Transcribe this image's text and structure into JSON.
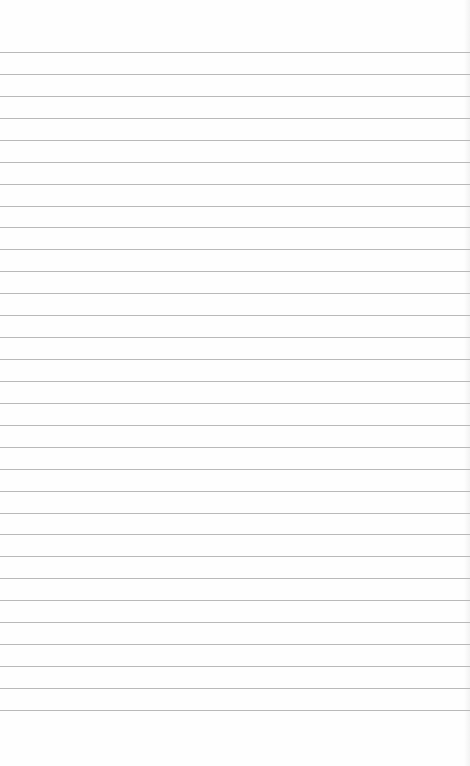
{
  "paper": {
    "type": "lined-notepad-page",
    "background_color": "#fefefe",
    "rule_color": "#b9b9b9",
    "first_rule_y": 52,
    "rule_spacing": 21.93,
    "rule_count": 31,
    "text_content": ""
  }
}
